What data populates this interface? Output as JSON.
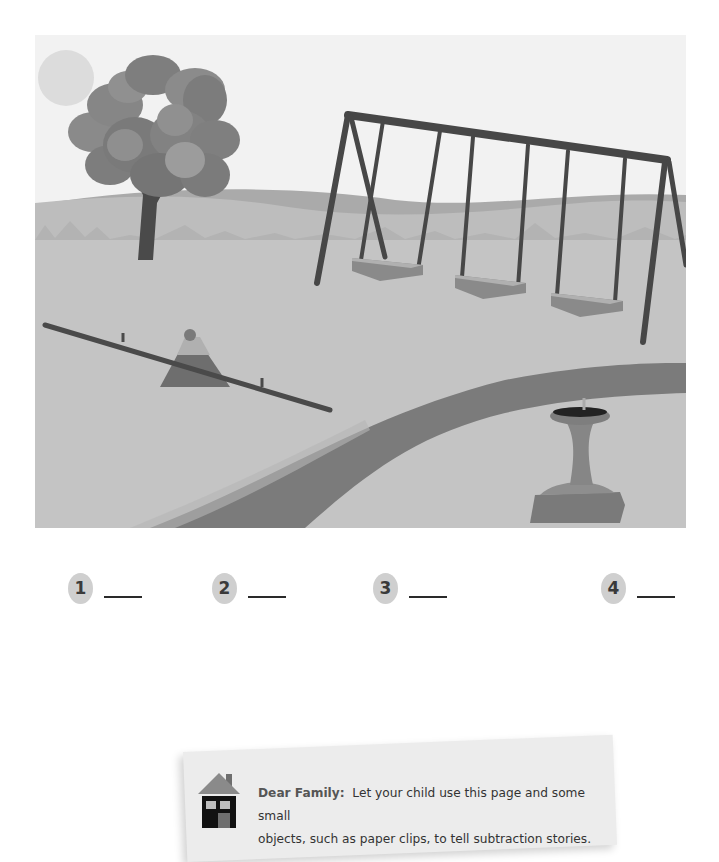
{
  "scene": {
    "description": "Playground illustration with a tree, swing set with three swings, a seesaw, a curved path and a drinking fountain",
    "objects": [
      "tree",
      "sun",
      "swing-set",
      "swing",
      "swing",
      "swing",
      "seesaw",
      "path",
      "drinking-fountain",
      "hills"
    ],
    "colors": {
      "sky": "#f2f2f2",
      "sun": "#dedede",
      "hill_far": "#a9a9a9",
      "hill_near": "#c0c0c0",
      "ground": "#c4c4c4",
      "path": "#7b7b7b",
      "frame": "#4a4a4a",
      "foliage_dark": "#7e7e7e",
      "foliage_light": "#9a9a9a"
    }
  },
  "answers": [
    {
      "number": "1",
      "value": ""
    },
    {
      "number": "2",
      "value": ""
    },
    {
      "number": "3",
      "value": ""
    },
    {
      "number": "4",
      "value": ""
    }
  ],
  "note": {
    "icon": "house-icon",
    "lead": "Dear Family:",
    "line1": "Let your child use this page and some small",
    "line2": "objects, such as paper clips, to tell subtraction stories."
  }
}
